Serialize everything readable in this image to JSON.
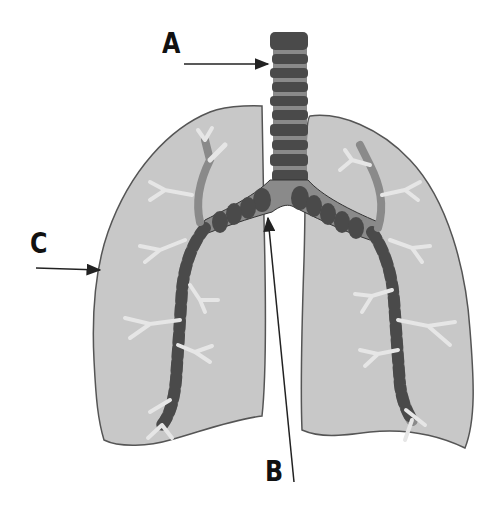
{
  "diagram": {
    "labels": [
      {
        "id": "A",
        "text": "A",
        "points_to": "trachea",
        "x": 162,
        "y": 30
      },
      {
        "id": "B",
        "text": "B",
        "points_to": "carina / bronchus junction",
        "x": 262,
        "y": 458
      },
      {
        "id": "C",
        "text": "C",
        "points_to": "lung outer wall",
        "x": 30,
        "y": 230
      }
    ],
    "structures": [
      "trachea",
      "left lung",
      "right lung",
      "primary bronchi",
      "secondary bronchi",
      "bronchioles"
    ],
    "colors": {
      "background": "#ffffff",
      "lung_fill": "#c8c8c8",
      "lung_outline": "#555555",
      "cartilage": "#4a4a4a",
      "airway_mid": "#8a8a8a",
      "airway_light": "#e6e6e6",
      "label": "#111111",
      "arrow": "#222222"
    }
  }
}
